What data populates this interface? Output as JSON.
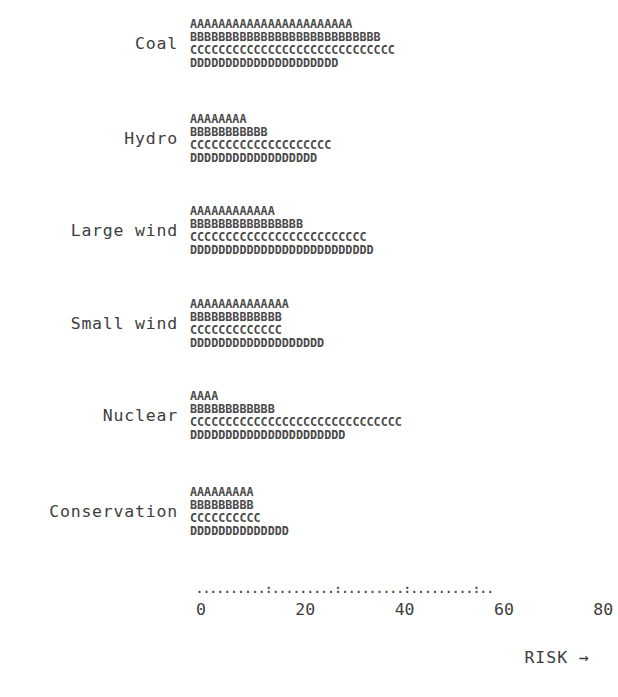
{
  "chart_data": {
    "type": "bar",
    "title": "",
    "subtitle": "",
    "xlabel": "RISK →",
    "ylabel": "",
    "xlim": [
      0,
      84
    ],
    "grid": false,
    "legend_position": "none",
    "style": "ascii-typewriter-bar-chart",
    "units_per_character": 2,
    "series_markers": [
      "A",
      "B",
      "C",
      "D"
    ],
    "categories": [
      "Coal",
      "Hydro",
      "Large wind",
      "Small wind",
      "Nuclear",
      "Conservation"
    ],
    "series": [
      {
        "name": "A",
        "char": "A",
        "counts": [
          23,
          8,
          12,
          14,
          4,
          9
        ],
        "values": [
          46,
          16,
          24,
          28,
          8,
          18
        ]
      },
      {
        "name": "B",
        "char": "B",
        "counts": [
          27,
          11,
          16,
          13,
          12,
          9
        ],
        "values": [
          54,
          22,
          32,
          26,
          24,
          18
        ]
      },
      {
        "name": "C",
        "char": "C",
        "counts": [
          29,
          20,
          25,
          13,
          30,
          10
        ],
        "values": [
          58,
          40,
          50,
          26,
          60,
          20
        ]
      },
      {
        "name": "D",
        "char": "D",
        "counts": [
          21,
          18,
          26,
          19,
          22,
          14
        ],
        "values": [
          42,
          36,
          52,
          38,
          44,
          28
        ]
      }
    ],
    "axis": {
      "tick_labels": [
        "0",
        "20",
        "40",
        "60",
        "80"
      ],
      "tick_values": [
        0,
        20,
        40,
        60,
        80
      ],
      "dot_count": 43,
      "dots_per_tick": 10,
      "dot_glyph": ".",
      "tick_glyph": ":",
      "tick_label_row": "0         20        40        60        80"
    },
    "groups": [
      {
        "label": "Coal",
        "rows": [
          {
            "marker": "A",
            "count": 23,
            "value": 46,
            "text": "AAAAAAAAAAAAAAAAAAAAAAA"
          },
          {
            "marker": "B",
            "count": 27,
            "value": 54,
            "text": "BBBBBBBBBBBBBBBBBBBBBBBBBBB"
          },
          {
            "marker": "C",
            "count": 29,
            "value": 58,
            "text": "CCCCCCCCCCCCCCCCCCCCCCCCCCCCC"
          },
          {
            "marker": "D",
            "count": 21,
            "value": 42,
            "text": "DDDDDDDDDDDDDDDDDDDDD"
          }
        ]
      },
      {
        "label": "Hydro",
        "rows": [
          {
            "marker": "A",
            "count": 8,
            "value": 16,
            "text": "AAAAAAAA"
          },
          {
            "marker": "B",
            "count": 11,
            "value": 22,
            "text": "BBBBBBBBBBB"
          },
          {
            "marker": "C",
            "count": 20,
            "value": 40,
            "text": "CCCCCCCCCCCCCCCCCCCC"
          },
          {
            "marker": "D",
            "count": 18,
            "value": 36,
            "text": "DDDDDDDDDDDDDDDDDD"
          }
        ]
      },
      {
        "label": "Large wind",
        "rows": [
          {
            "marker": "A",
            "count": 12,
            "value": 24,
            "text": "AAAAAAAAAAAA"
          },
          {
            "marker": "B",
            "count": 16,
            "value": 32,
            "text": "BBBBBBBBBBBBBBBB"
          },
          {
            "marker": "C",
            "count": 25,
            "value": 50,
            "text": "CCCCCCCCCCCCCCCCCCCCCCCCC"
          },
          {
            "marker": "D",
            "count": 26,
            "value": 52,
            "text": "DDDDDDDDDDDDDDDDDDDDDDDDDD"
          }
        ]
      },
      {
        "label": "Small wind",
        "rows": [
          {
            "marker": "A",
            "count": 14,
            "value": 28,
            "text": "AAAAAAAAAAAAAA"
          },
          {
            "marker": "B",
            "count": 13,
            "value": 26,
            "text": "BBBBBBBBBBBBB"
          },
          {
            "marker": "C",
            "count": 13,
            "value": 26,
            "text": "CCCCCCCCCCCCC"
          },
          {
            "marker": "D",
            "count": 19,
            "value": 38,
            "text": "DDDDDDDDDDDDDDDDDDD"
          }
        ]
      },
      {
        "label": "Nuclear",
        "rows": [
          {
            "marker": "A",
            "count": 4,
            "value": 8,
            "text": "AAAA"
          },
          {
            "marker": "B",
            "count": 12,
            "value": 24,
            "text": "BBBBBBBBBBBB"
          },
          {
            "marker": "C",
            "count": 30,
            "value": 60,
            "text": "CCCCCCCCCCCCCCCCCCCCCCCCCCCCCC"
          },
          {
            "marker": "D",
            "count": 22,
            "value": 44,
            "text": "DDDDDDDDDDDDDDDDDDDDDD"
          }
        ]
      },
      {
        "label": "Conservation",
        "rows": [
          {
            "marker": "A",
            "count": 9,
            "value": 18,
            "text": "AAAAAAAAA"
          },
          {
            "marker": "B",
            "count": 9,
            "value": 18,
            "text": "BBBBBBBBB"
          },
          {
            "marker": "C",
            "count": 10,
            "value": 20,
            "text": "CCCCCCCCCC"
          },
          {
            "marker": "D",
            "count": 14,
            "value": 28,
            "text": "DDDDDDDDDDDDDD"
          }
        ]
      }
    ]
  },
  "colors": {
    "background": "#ffffff",
    "text": "#3d3d3d",
    "bar_text": "#4a4a4a"
  }
}
